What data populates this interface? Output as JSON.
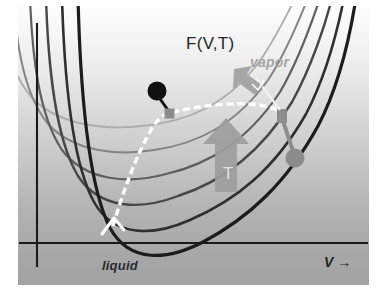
{
  "figure": {
    "kind": "free-energy-landscape-diagram",
    "width": 378,
    "height": 296,
    "background_top_color": "#fdfdfd",
    "background_bottom_color": "#a2a2a2"
  },
  "labels": {
    "title": "F(V,T)",
    "vapor": "vapor",
    "liquid": "liquid",
    "x_axis": "V →",
    "temperature_arrow": "T"
  },
  "axes": {
    "x_axis_label": "V →",
    "y_axis_label": "F(V,T)",
    "x_axis_y_px": 237,
    "y_axis_x_px": 19,
    "axis_color": "#1a1a1a"
  },
  "markers": {
    "critical_point": {
      "name": "black-filled-circle",
      "shape": "circle",
      "color": "#111111",
      "x": 139,
      "y": 87,
      "radius": 9
    },
    "liquid_branch_square": {
      "name": "gray-square-left",
      "shape": "square",
      "color": "#8c8c8c",
      "x": 151,
      "y": 113,
      "size": 9
    },
    "vapor_branch_square": {
      "name": "gray-square-right",
      "shape": "square",
      "color": "#8c8c8c",
      "x": 264,
      "y": 118,
      "size": 9
    },
    "vapor_point": {
      "name": "gray-filled-circle",
      "shape": "circle",
      "color": "#8c8c8c",
      "x": 277,
      "y": 154,
      "radius": 9
    }
  },
  "annotations": {
    "vapor_arrow": {
      "name": "vapor-arrow",
      "color": "#a6a6a6",
      "direction": "up-left"
    },
    "temperature_arrow": {
      "name": "temperature-arrow",
      "color": "#9d9d9d",
      "direction": "up",
      "letter": "T"
    },
    "spinodal_arrow": {
      "name": "white-dashed-arrowhead",
      "color": "#ffffff",
      "direction": "up-right"
    }
  },
  "chart_data": {
    "type": "line",
    "title": "F(V,T)",
    "xlabel": "V →",
    "ylabel": "F(V,T)",
    "grid": false,
    "legend": "none",
    "series": [
      {
        "name": "isotherm-1-lowest-T",
        "color": "#1c1c1c",
        "width": 3.2,
        "path": "M 60 -8 C 62 70, 68 175, 92 222 C 112 258, 150 254, 185 236 C 230 212, 268 178, 300 120 C 320 82, 332 30, 338 -8"
      },
      {
        "name": "isotherm-2",
        "color": "#2f2f2f",
        "width": 2.6,
        "path": "M 44 -8 C 46 62, 52 152, 76 196 C 96 232, 136 230, 172 214 C 218 194, 256 164, 288 108 C 308 70, 320 22, 326 -8"
      },
      {
        "name": "isotherm-3",
        "color": "#474747",
        "width": 2.4,
        "path": "M 28 -8 C 30 54, 36 130, 60 170 C 82 204, 124 204, 160 190 C 204 176, 242 148, 274 96 C 294 60, 308 16, 314 -8"
      },
      {
        "name": "isotherm-4",
        "color": "#5f5f5f",
        "width": 2.2,
        "path": "M 12 -8 C 14 46, 20 108, 44 144 C 68 176, 112 178, 148 168 C 192 158, 230 134, 262 86 C 282 52, 296 10, 302 -8"
      },
      {
        "name": "isotherm-5",
        "color": "#848484",
        "width": 2.0,
        "path": "M -4 -8 C -2 38, 6 88, 30 118 C 56 146, 100 150, 136 144 C 180 138, 218 118, 250 74 C 270 44, 284 6, 290 -8"
      },
      {
        "name": "isotherm-6-highest-T",
        "color": "#adadad",
        "width": 1.9,
        "path": "M -18 -8 C -16 30, -8 68, 16 94 C 44 120, 88 124, 124 120 C 168 116, 206 100, 238 60 C 258 34, 272 0, 278 -8"
      }
    ],
    "coexistence_curve": {
      "name": "binodal-dashed-curve",
      "style": "dashed",
      "color": "#ffffff",
      "width": 3.4,
      "dash": "7,4",
      "path": "M 95 220 C 105 186, 118 150, 133 124 C 140 112, 146 108, 152 107 C 178 100, 206 97, 232 98 C 246 99, 256 102, 264 106"
    },
    "critical_stem": {
      "name": "critical-point-stem",
      "color": "#111111",
      "width": 3.0,
      "path": "M 152 107 L 139 88"
    },
    "vapor_stem": {
      "name": "vapor-point-stem",
      "color": "#8c8c8c",
      "width": 3.4,
      "path": "M 264 112 L 277 150"
    }
  }
}
